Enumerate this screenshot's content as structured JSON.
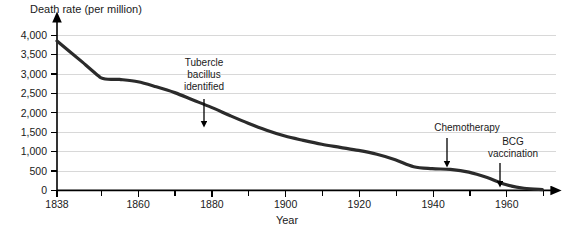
{
  "chart_data": {
    "type": "line",
    "title": "",
    "xlabel": "Year",
    "ylabel": "Death rate (per million)",
    "xlim": [
      1838,
      1972
    ],
    "ylim": [
      0,
      4000
    ],
    "grid": true,
    "legend": "none",
    "x_ticks": [
      1838,
      1860,
      1880,
      1900,
      1920,
      1940,
      1960
    ],
    "x_tick_labels": [
      "1838",
      "1860",
      "1880",
      "1900",
      "1920",
      "1940",
      "1960"
    ],
    "x_minor_ticks": [
      1850,
      1870,
      1890,
      1910,
      1930,
      1950,
      1970
    ],
    "y_ticks": [
      0,
      500,
      1000,
      1500,
      2000,
      2500,
      3000,
      3500,
      4000
    ],
    "y_tick_labels": [
      "0",
      "500",
      "1,000",
      "1,500",
      "2,000",
      "2,500",
      "3,000",
      "3,500",
      "4,000"
    ],
    "series": [
      {
        "name": "Tuberculosis death rate",
        "x": [
          1838,
          1845,
          1850,
          1855,
          1860,
          1865,
          1870,
          1875,
          1880,
          1885,
          1890,
          1895,
          1900,
          1905,
          1910,
          1915,
          1920,
          1925,
          1930,
          1935,
          1940,
          1945,
          1950,
          1955,
          1960,
          1965,
          1970
        ],
        "values": [
          3850,
          3300,
          2900,
          2860,
          2800,
          2670,
          2520,
          2330,
          2140,
          1930,
          1730,
          1550,
          1400,
          1290,
          1190,
          1110,
          1030,
          930,
          790,
          610,
          560,
          540,
          470,
          330,
          150,
          55,
          20
        ]
      }
    ],
    "annotations": [
      {
        "id": "tubercle-bacillus",
        "text_lines": [
          "Tubercle",
          "bacillus",
          "identified"
        ],
        "year": 1882,
        "label_x": 204,
        "label_y": 66,
        "arrow_x": 204,
        "arrow_top_y": 100,
        "arrow_bottom_y": 125
      },
      {
        "id": "chemotherapy",
        "text_lines": [
          "Chemotherapy"
        ],
        "year": 1947,
        "label_x": 467,
        "label_y": 130,
        "arrow_x": 447,
        "arrow_top_y": 137,
        "arrow_bottom_y": 165
      },
      {
        "id": "bcg-vaccination",
        "text_lines": [
          "BCG",
          "vaccination"
        ],
        "year": 1958,
        "label_x": 513,
        "label_y": 145,
        "arrow_x": 500,
        "arrow_top_y": 158,
        "arrow_bottom_y": 180
      }
    ],
    "colors": {
      "line": "#2b2b2b",
      "axis": "#000000",
      "grid": "#d8d8d8",
      "text": "#1a1a1a",
      "background": "#ffffff"
    }
  }
}
